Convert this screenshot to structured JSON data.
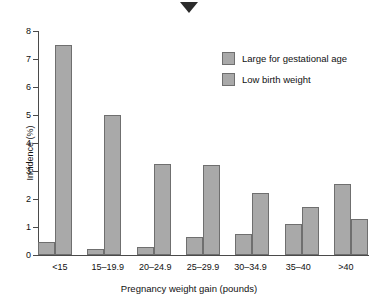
{
  "marker": {
    "name": "down-triangle-marker"
  },
  "chart_data": {
    "type": "bar",
    "title": "",
    "xlabel": "Pregnancy weight gain (pounds)",
    "ylabel": "Incidence (%)",
    "ylim": [
      0,
      8
    ],
    "yticks": [
      0,
      1,
      2,
      3,
      4,
      5,
      6,
      7,
      8
    ],
    "grid": false,
    "legend_position": "upper-right",
    "categories": [
      "<15",
      "15–19.9",
      "20–24.9",
      "25–29.9",
      "30–34.9",
      "35–40",
      ">40"
    ],
    "series": [
      {
        "name": "Large for gestational age",
        "color": "#a9a9a9",
        "values": [
          0.45,
          0.2,
          0.3,
          0.65,
          0.75,
          1.1,
          2.55
        ]
      },
      {
        "name": "Low birth weight",
        "color": "#a9a9a9",
        "values": [
          7.5,
          5.0,
          3.25,
          3.2,
          2.2,
          1.7,
          1.3
        ]
      }
    ]
  }
}
